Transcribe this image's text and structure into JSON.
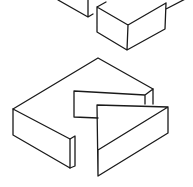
{
  "figure": {
    "type": "isometric line drawing",
    "stroke_color": "#1a1a1a",
    "background_color": "#ffffff",
    "caption_fragment": ""
  },
  "shapes": {
    "top_block_partial": "M58,0 L88,17 L88,0 M88,17 L93,14",
    "upper_block": "M97,7 L128,25 L166,3 M97,7 L97,32 L127,50 L165,29 L166,3 M128,25 L127,50 M106,2 L97,7 M166,9 L193,-5",
    "lower_block_top": "M13,109 L98,58 L153,89",
    "lower_block_front": "M13,109 L13,135 L70,168 L70,139 L13,109",
    "lower_block_notch_face": "M70,139 L75,136 L75,166 L70,168",
    "notch_inner": "M74,117 L74,91 L145,95 L153,89 L153,104 M145,95 L145,104 M74,117 L98,118",
    "wedge_piece": "M97,105 L168,107 L168,133 L98,176 L97,105 M98,150 L168,107 M98,150 L98,176"
  }
}
